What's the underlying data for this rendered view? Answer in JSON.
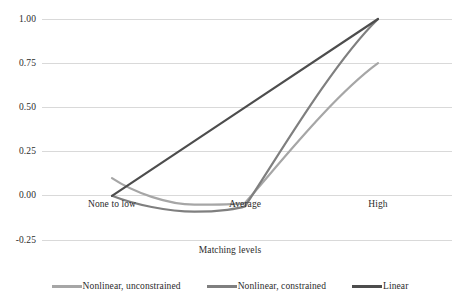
{
  "chart_data": {
    "type": "line",
    "title": "",
    "xlabel": "Matching levels",
    "ylabel": "",
    "categories": [
      "None to low",
      "Average",
      "High"
    ],
    "x": [
      0,
      1,
      2
    ],
    "ylim": [
      -0.25,
      1.0
    ],
    "yticks": [
      "1.00",
      "0.75",
      "0.50",
      "0.25",
      "0.00",
      "-0.25"
    ],
    "ytick_values": [
      1.0,
      0.75,
      0.5,
      0.25,
      0.0,
      -0.25
    ],
    "grid": true,
    "legend_position": "bottom",
    "series": [
      {
        "name": "Nonlinear, unconstrained",
        "color": "#a6a6a6",
        "values": [
          0.1,
          -0.04,
          0.75
        ],
        "curve": "smooth",
        "min_value": -0.05
      },
      {
        "name": "Nonlinear, constrained",
        "color": "#7f7f7f",
        "values": [
          0.0,
          -0.06,
          1.0
        ],
        "curve": "smooth",
        "min_value": -0.09
      },
      {
        "name": "Linear",
        "color": "#4d4d4d",
        "values": [
          0.0,
          0.5,
          1.0
        ],
        "curve": "straight",
        "min_value": 0.0
      }
    ]
  },
  "axis": {
    "x_tick_labels": [
      "None to low",
      "Average",
      "High"
    ],
    "y_tick_labels": [
      "1.00",
      "0.75",
      "0.50",
      "0.25",
      "0.00",
      "-0.25"
    ],
    "x_title": "Matching levels"
  },
  "legend": {
    "items": [
      {
        "label": "Nonlinear, unconstrained",
        "color": "#a6a6a6"
      },
      {
        "label": "Nonlinear, constrained",
        "color": "#7f7f7f"
      },
      {
        "label": "Linear",
        "color": "#4d4d4d"
      }
    ]
  },
  "colors": {
    "gridline": "#d9d9d9",
    "text": "#2b2b2b",
    "background": "#ffffff"
  }
}
